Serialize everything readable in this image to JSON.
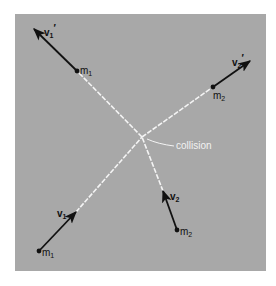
{
  "figure": {
    "colors": {
      "panel": "#a8a8a8",
      "path": "#f4f4f4",
      "vector": "#111111",
      "text": "#111111",
      "collision_text": "#f2f2f2"
    }
  },
  "annotations": {
    "collision": "collision"
  },
  "bodies": [
    {
      "id": "m1_before",
      "mass_label": "m",
      "mass_sub": "1",
      "vector_label": "v",
      "vector_sub": "1",
      "vector_prime": ""
    },
    {
      "id": "m2_before",
      "mass_label": "m",
      "mass_sub": "2",
      "vector_label": "v",
      "vector_sub": "2",
      "vector_prime": ""
    },
    {
      "id": "m1_after",
      "mass_label": "m",
      "mass_sub": "1",
      "vector_label": "v",
      "vector_sub": "1",
      "vector_prime": "′"
    },
    {
      "id": "m2_after",
      "mass_label": "m",
      "mass_sub": "2",
      "vector_label": "v",
      "vector_sub": "2",
      "vector_prime": "′"
    }
  ]
}
